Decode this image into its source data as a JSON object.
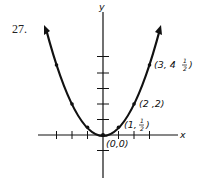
{
  "problem": {
    "number": "27."
  },
  "axes": {
    "x_label": "x",
    "y_label": "y",
    "origin_px": [
      103,
      135
    ],
    "unit_px": 15.5,
    "x_ticks": [
      -3,
      -2,
      -1,
      1,
      2,
      3
    ],
    "y_ticks": [
      -1,
      1,
      2,
      3,
      4,
      5
    ]
  },
  "curve": {
    "equation": "y = x^2 / 2",
    "x_range": [
      -3.7,
      3.7
    ]
  },
  "points": [
    {
      "x": 0,
      "y": 0,
      "label": "(0,0)"
    },
    {
      "x": 1,
      "y": 0.5,
      "label": "(1, 1/2)"
    },
    {
      "x": 2,
      "y": 2,
      "label": "(2,2)"
    },
    {
      "x": 3,
      "y": 4.5,
      "label": "(3, 4 1/2)"
    },
    {
      "x": -1,
      "y": 0.5,
      "label": ""
    },
    {
      "x": -2,
      "y": 2,
      "label": ""
    },
    {
      "x": -3,
      "y": 4.5,
      "label": ""
    }
  ],
  "labels": {
    "origin": "(0,0)",
    "p1": "(1,",
    "p1_frac_num": "1",
    "p1_frac_den": "2",
    "p2": "(2 ,2)",
    "p3": "(3, 4",
    "p3_frac_num": "1",
    "p3_frac_den": "2"
  }
}
